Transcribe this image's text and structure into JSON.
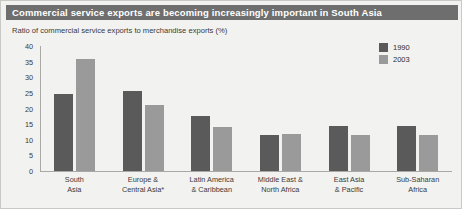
{
  "title": "Commercial service exports are becoming increasingly important in South Asia",
  "subtitle": "Ratio of commercial service exports to merchandise exports (%)",
  "colors": {
    "series_1990": "#5a5a5a",
    "series_2003": "#9a9a9a",
    "title_bar": "#6e6e6e",
    "panel_background": "#f2f2f0",
    "axis": "#a8a8a5"
  },
  "legend": {
    "position": "top-right",
    "entries": [
      {
        "label": "1990",
        "color": "#5a5a5a"
      },
      {
        "label": "2003",
        "color": "#9a9a9a"
      }
    ]
  },
  "axis": {
    "y_ticks": [
      "40",
      "35",
      "30",
      "25",
      "20",
      "15",
      "10",
      "5",
      "0"
    ]
  },
  "chart_data": {
    "type": "bar",
    "title": "Commercial service exports are becoming increasingly important in South Asia",
    "subtitle": "Ratio of commercial service exports to merchandise exports (%)",
    "xlabel": "",
    "ylabel": "Ratio of commercial service exports to merchandise exports (%)",
    "ylim": [
      0,
      40
    ],
    "ytick_values": [
      0,
      5,
      10,
      15,
      20,
      25,
      30,
      35,
      40
    ],
    "grid": false,
    "legend_position": "top-right",
    "categories": [
      "South Asia",
      "Europe & Central Asia*",
      "Latin America & Caribbean",
      "Middle East & North Africa",
      "East Asia & Pacific",
      "Sub-Saharan Africa"
    ],
    "series": [
      {
        "name": "1990",
        "color": "#5a5a5a",
        "values": [
          24.5,
          25.5,
          17.5,
          11.5,
          14.5,
          14.5
        ]
      },
      {
        "name": "2003",
        "color": "#9a9a9a",
        "values": [
          36.0,
          21.0,
          14.0,
          12.0,
          11.5,
          11.5
        ]
      }
    ]
  }
}
